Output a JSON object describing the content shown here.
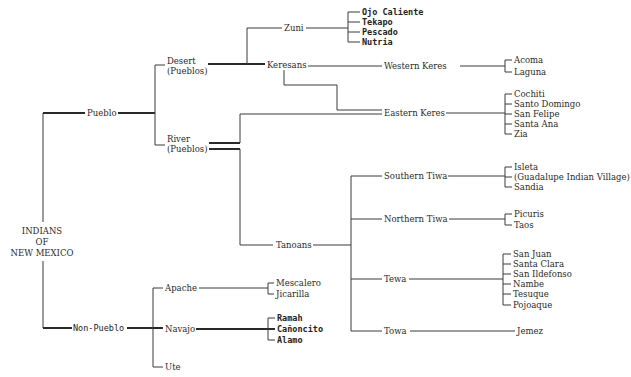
{
  "diagram": {
    "title": "INDIANS OF NEW MEXICO",
    "root": {
      "label_lines": [
        "INDIANS",
        "OF",
        "NEW MEXICO"
      ]
    },
    "labels": {
      "pueblo": "Pueblo",
      "non_pueblo": "Non-Pueblo",
      "desert_1": "Desert",
      "desert_2": "(Pueblos)",
      "river_1": "River",
      "river_2": "(Pueblos)",
      "zuni": "Zuni",
      "keresans": "Keresans",
      "western_keres": "Western Keres",
      "eastern_keres": "Eastern Keres",
      "tanoans": "Tanoans",
      "southern_tiwa": "Southern Tiwa",
      "northern_tiwa": "Northern Tiwa",
      "tewa": "Tewa",
      "towa": "Towa",
      "apache": "Apache",
      "navajo": "Navajo",
      "ute": "Ute"
    },
    "leaves": {
      "zuni": [
        "Ojo Caliente",
        "Tekapo",
        "Pescado",
        "Nutria"
      ],
      "western_keres": [
        "Acoma",
        "Laguna"
      ],
      "eastern_keres": [
        "Cochiti",
        "Santo Domingo",
        "San Felipe",
        "Santa Ana",
        "Zia"
      ],
      "southern_tiwa": [
        "Isleta",
        "(Guadalupe Indian Village)",
        "Sandia"
      ],
      "northern_tiwa": [
        "Picuris",
        "Taos"
      ],
      "tewa": [
        "San Juan",
        "Santa Clara",
        "San Ildefonso",
        "Nambe",
        "Tesuque",
        "Pojoaque"
      ],
      "towa": [
        "Jemez"
      ],
      "apache": [
        "Mescalero",
        "Jicarilla"
      ],
      "navajo": [
        "Ramah",
        "Cañoncito",
        "Alamo"
      ]
    },
    "tree": {
      "label": "Indians of New Mexico",
      "children": [
        {
          "label": "Pueblo",
          "children": [
            {
              "label": "Desert (Pueblos)",
              "children": [
                {
                  "label": "Zuni",
                  "children": [
                    "Ojo Caliente",
                    "Tekapo",
                    "Pescado",
                    "Nutria"
                  ]
                },
                {
                  "label": "Keresans",
                  "children": [
                    {
                      "label": "Western Keres",
                      "children": [
                        "Acoma",
                        "Laguna"
                      ]
                    },
                    {
                      "label": "Eastern Keres",
                      "children": [
                        "Cochiti",
                        "Santo Domingo",
                        "San Felipe",
                        "Santa Ana",
                        "Zia"
                      ]
                    }
                  ]
                }
              ]
            },
            {
              "label": "River (Pueblos)",
              "children": [
                {
                  "label": "Eastern Keres"
                },
                {
                  "label": "Tanoans",
                  "children": [
                    {
                      "label": "Southern Tiwa",
                      "children": [
                        "Isleta",
                        "(Guadalupe Indian Village)",
                        "Sandia"
                      ]
                    },
                    {
                      "label": "Northern Tiwa",
                      "children": [
                        "Picuris",
                        "Taos"
                      ]
                    },
                    {
                      "label": "Tewa",
                      "children": [
                        "San Juan",
                        "Santa Clara",
                        "San Ildefonso",
                        "Nambe",
                        "Tesuque",
                        "Pojoaque"
                      ]
                    },
                    {
                      "label": "Towa",
                      "children": [
                        "Jemez"
                      ]
                    }
                  ]
                }
              ]
            }
          ]
        },
        {
          "label": "Non-Pueblo",
          "children": [
            {
              "label": "Apache",
              "children": [
                "Mescalero",
                "Jicarilla"
              ]
            },
            {
              "label": "Navajo",
              "children": [
                "Ramah",
                "Cañoncito",
                "Alamo"
              ]
            },
            {
              "label": "Ute"
            }
          ]
        }
      ]
    }
  }
}
